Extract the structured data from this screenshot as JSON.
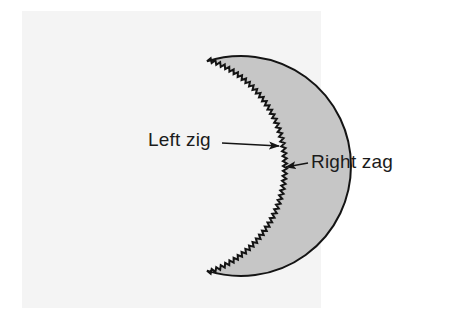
{
  "figure": {
    "panel": {
      "background_color": "#f4f4f4",
      "page_background_color": "#ffffff",
      "x": 22,
      "y": 11,
      "width": 299,
      "height": 297
    },
    "shape": {
      "name": "circle",
      "fill_color": "#c6c6c6",
      "stroke_color": "#141414",
      "stroke_width": 2,
      "center_x": 173,
      "center_y": 166,
      "radius": 110,
      "zigzag_edge": {
        "present": true,
        "description": "fine sawtooth teeth along the right-hand arc",
        "tooth_count": 56,
        "tooth_height": 4,
        "arc_start_degrees": -72,
        "arc_end_degrees": 72
      }
    },
    "annotations": [
      {
        "id": "left-zig",
        "label": "Left zig",
        "text_x": 148,
        "text_y": 130,
        "leader_from_x": 222,
        "leader_from_y": 143,
        "leader_to_x": 279,
        "leader_to_y": 146,
        "arrow_direction": "right"
      },
      {
        "id": "right-zag",
        "label": "Right zag",
        "text_x": 311,
        "text_y": 152,
        "leader_from_x": 308,
        "leader_from_y": 163,
        "leader_to_x": 286,
        "leader_to_y": 167,
        "arrow_direction": "left"
      }
    ],
    "colors": {
      "ink": "#1b1b1b",
      "fill": "#c6c6c6",
      "outline": "#141414"
    }
  }
}
